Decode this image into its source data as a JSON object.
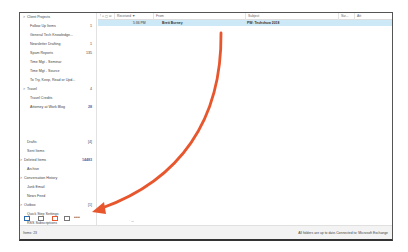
{
  "folders": [
    {
      "label": "Client Projects",
      "count": "",
      "indent": 1,
      "chevron": ">",
      "top": 0
    },
    {
      "label": "Follow Up Items",
      "count": "1",
      "indent": 2,
      "chevron": "",
      "top": 9
    },
    {
      "label": "General Tech Knowledge...",
      "count": "",
      "indent": 2,
      "chevron": "",
      "top": 18
    },
    {
      "label": "Newsletter Drafting",
      "count": "1",
      "indent": 2,
      "chevron": "",
      "top": 27
    },
    {
      "label": "Spam Reports",
      "count": "135",
      "indent": 2,
      "chevron": "",
      "top": 36
    },
    {
      "label": "Time Mgt - Seminar",
      "count": "",
      "indent": 2,
      "chevron": "",
      "top": 45
    },
    {
      "label": "Time Mgt - Source",
      "count": "",
      "indent": 2,
      "chevron": "",
      "top": 54
    },
    {
      "label": "To Try, Keep, Read or Upd...",
      "count": "",
      "indent": 2,
      "chevron": "",
      "top": 63
    },
    {
      "label": "Travel",
      "count": "4",
      "indent": 1,
      "chevron": ">",
      "top": 72
    },
    {
      "label": "Travel Credits",
      "count": "",
      "indent": 2,
      "chevron": "",
      "top": 81
    },
    {
      "label": "Attorney at Work Blog",
      "count": "28",
      "indent": 2,
      "chevron": "",
      "top": 90,
      "count_blue": true
    },
    {
      "label": "Drafts",
      "count": "[4]",
      "indent": 1,
      "chevron": "",
      "top": 125
    },
    {
      "label": "Sent Items",
      "count": "",
      "indent": 1,
      "chevron": "",
      "top": 134
    },
    {
      "label": "Deleted Items",
      "count": "14483",
      "indent": 0,
      "chevron": ">",
      "top": 143,
      "count_blue": true
    },
    {
      "label": "Archive",
      "count": "",
      "indent": 1,
      "chevron": "",
      "top": 152
    },
    {
      "label": "Conversation History",
      "count": "",
      "indent": 0,
      "chevron": ">",
      "top": 161
    },
    {
      "label": "Junk Email",
      "count": "",
      "indent": 1,
      "chevron": "",
      "top": 170
    },
    {
      "label": "News Feed",
      "count": "",
      "indent": 1,
      "chevron": "",
      "top": 179
    },
    {
      "label": "Outbox",
      "count": "[1]",
      "indent": 0,
      "chevron": ">",
      "top": 188
    },
    {
      "label": "Quick Step Settings",
      "count": "",
      "indent": 1,
      "chevron": "",
      "top": 197
    },
    {
      "label": "RSS Subscriptions",
      "count": "",
      "indent": 1,
      "chevron": "",
      "top": 206
    }
  ],
  "nav": {
    "icons": [
      "mail-icon",
      "calendar-icon",
      "people-icon",
      "tasks-icon"
    ],
    "more": "•••"
  },
  "list": {
    "columns": {
      "flags": "! ⌂ ▢ ✉",
      "received": "Received ▼",
      "from": "From",
      "subject": "Subject",
      "size": "Siz...",
      "cat": "Att"
    },
    "rows": [
      {
        "received": "5:36 PM",
        "from": "Brett Burney",
        "subject": "PW: Techshow 2018"
      }
    ],
    "tick": "·→"
  },
  "status": {
    "items": "Items: 23",
    "sync": "All folders are up to date.",
    "connection": "Connected to: Microsoft Exchange"
  },
  "annotation": {
    "arrow_color": "#e8562e"
  }
}
